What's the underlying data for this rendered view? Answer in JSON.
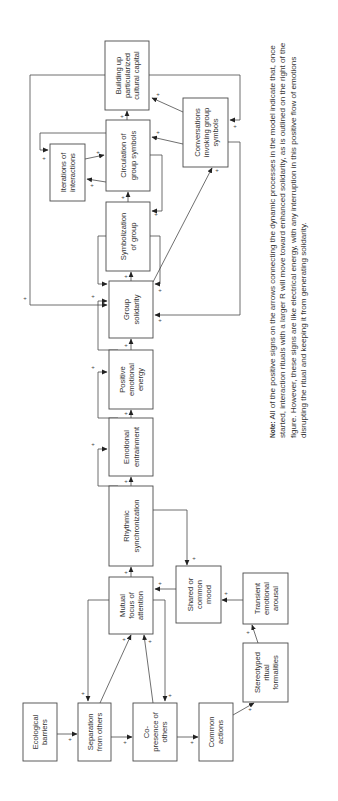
{
  "diagram": {
    "orientation": "rotated 90deg counter-clockwise",
    "nodes": [
      {
        "id": "ecological",
        "lines": [
          "Ecological",
          "barriers"
        ]
      },
      {
        "id": "separation",
        "lines": [
          "Separation",
          "from others"
        ]
      },
      {
        "id": "copresence",
        "lines": [
          "Co-",
          "presence of",
          "others"
        ]
      },
      {
        "id": "common_actions",
        "lines": [
          "Common",
          "actions"
        ]
      },
      {
        "id": "stereotyped",
        "lines": [
          "Stereotyped",
          "ritual",
          "formalities"
        ]
      },
      {
        "id": "transient",
        "lines": [
          "Transient",
          "emotional",
          "arousal"
        ]
      },
      {
        "id": "shared_mood",
        "lines": [
          "Shared or",
          "common",
          "mood"
        ]
      },
      {
        "id": "mutual_focus",
        "lines": [
          "Mutual",
          "focus of",
          "attention"
        ]
      },
      {
        "id": "rhythmic",
        "lines": [
          "Rhythmic",
          "synchronization"
        ]
      },
      {
        "id": "entrainment",
        "lines": [
          "Emotional",
          "entrainment"
        ]
      },
      {
        "id": "positive_ee",
        "lines": [
          "Positive",
          "emotional",
          "energy"
        ]
      },
      {
        "id": "solidarity",
        "lines": [
          "Group",
          "solidarity"
        ]
      },
      {
        "id": "symbolization",
        "lines": [
          "Symbolization",
          "of group"
        ]
      },
      {
        "id": "circulation",
        "lines": [
          "Circulation of",
          "group symbols"
        ]
      },
      {
        "id": "iterations",
        "lines": [
          "Iterations of",
          "interactions"
        ]
      },
      {
        "id": "conversations",
        "lines": [
          "Conversations",
          "invoking group",
          "symbols"
        ]
      },
      {
        "id": "cultural_capital",
        "lines": [
          "Building up",
          "particularized",
          "cultural capital"
        ]
      }
    ],
    "edge_sign": "+",
    "note": {
      "label": "Note",
      "text": "All of the positive signs on the arrows connecting the dynamic processes in the model indicate that, once started, interaction rituals with a larger R will move toward enhanced solidarity, as is outlined on the right of the figure. However, these signs are like electrical energy, with any interruption in this positive flow of emotions disrupting the ritual and keeping it from generating solidarity."
    }
  }
}
